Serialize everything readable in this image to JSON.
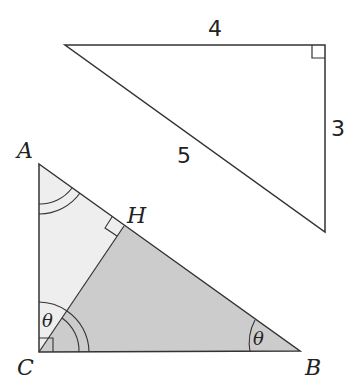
{
  "reference_triangle": {
    "side_top": "4",
    "side_right": "3",
    "hypotenuse": "5"
  },
  "main_triangle": {
    "vertex_a": "A",
    "vertex_b": "B",
    "vertex_c": "C",
    "foot_h": "H",
    "angle_c": "θ",
    "angle_b": "θ"
  },
  "colors": {
    "stroke": "#333333",
    "light_fill": "#eeeeee",
    "dark_fill": "#cccccc"
  }
}
